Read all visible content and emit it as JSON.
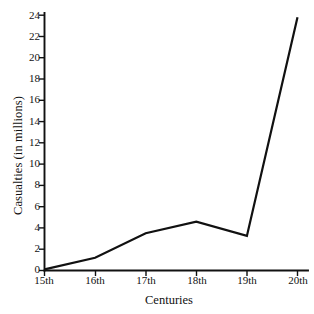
{
  "chart_data": {
    "type": "line",
    "title": "",
    "xlabel": "Centuries",
    "ylabel": "Casualties (in millions)",
    "categories": [
      "15th",
      "16th",
      "17th",
      "18th",
      "19th",
      "20th"
    ],
    "values": [
      0.1,
      1.2,
      3.5,
      4.6,
      3.25,
      23.8
    ],
    "series": [
      {
        "name": "Casualties",
        "values": [
          0.1,
          1.2,
          3.5,
          4.6,
          3.25,
          23.8
        ],
        "color": "#111111"
      }
    ],
    "ylim": [
      0,
      24
    ],
    "xlim": [
      "15th",
      "20th"
    ],
    "ytick_labels": [
      "0",
      "2",
      "4",
      "6",
      "8",
      "10",
      "12",
      "14",
      "16",
      "18",
      "20",
      "22",
      "24"
    ],
    "ytick_values": [
      0,
      2,
      4,
      6,
      8,
      10,
      12,
      14,
      16,
      18,
      20,
      22,
      24
    ],
    "xtick_labels": [
      "15th",
      "16th",
      "17th",
      "18th",
      "19th",
      "20th"
    ],
    "grid": false,
    "legend": "none",
    "line_color": "#111111",
    "background_color": "#ffffff"
  },
  "axes": {
    "y_label": "Casualties (in millions)",
    "x_label": "Centuries"
  }
}
